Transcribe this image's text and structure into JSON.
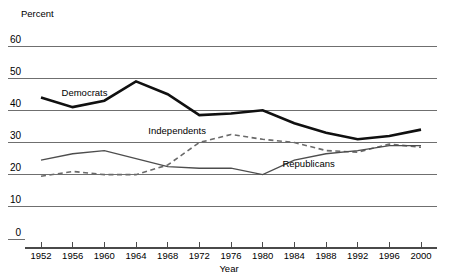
{
  "chart_data": {
    "type": "line",
    "title": "",
    "xlabel": "Year",
    "ylabel": "Percent",
    "ylim": [
      0,
      60
    ],
    "ytick_values": [
      0,
      10,
      20,
      30,
      40,
      50,
      60
    ],
    "ytick_labels": [
      "0",
      "10",
      "20",
      "30",
      "40",
      "50",
      "60"
    ],
    "grid": true,
    "legend_position": "inline-annotations",
    "categories": [
      1952,
      1956,
      1960,
      1964,
      1968,
      1972,
      1976,
      1980,
      1984,
      1988,
      1992,
      1996,
      2000
    ],
    "xtick_labels": [
      "1952",
      "1956",
      "1960",
      "1964",
      "1968",
      "1972",
      "1976",
      "1980",
      "1984",
      "1988",
      "1992",
      "1996",
      "2000"
    ],
    "series": [
      {
        "name": "Democrats",
        "style": "solid-thick",
        "color": "#101010",
        "label_x": 1957.5,
        "label_y": 44.5,
        "values": [
          44,
          41,
          43,
          49,
          45,
          38.5,
          39,
          40,
          36,
          33,
          31,
          32,
          34
        ]
      },
      {
        "name": "Independents",
        "style": "dashed",
        "color": "#6a6a6a",
        "label_x": 1969.2,
        "label_y": 32.5,
        "values": [
          19.5,
          21,
          20,
          20,
          23,
          30,
          32.5,
          31,
          30,
          27.5,
          27,
          29.5,
          28.5
        ]
      },
      {
        "name": "Republicans",
        "style": "solid-thin",
        "color": "#4d4d4d",
        "label_x": 1985.8,
        "label_y": 22.5,
        "values": [
          24.5,
          26.5,
          27.5,
          25,
          22.5,
          22,
          22,
          20,
          24.5,
          26.5,
          27.5,
          29,
          29
        ]
      }
    ]
  }
}
